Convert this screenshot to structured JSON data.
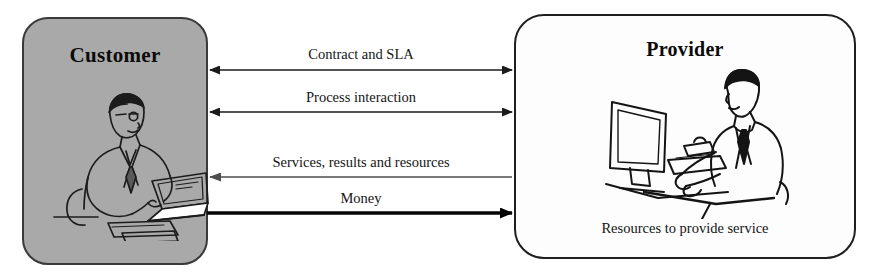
{
  "diagram": {
    "canvas": {
      "width": 873,
      "height": 276,
      "background": "#ffffff"
    },
    "entities": [
      {
        "id": "customer",
        "label": "Customer",
        "caption": "",
        "fill": "#a9a9a9",
        "stroke": "#3a3a3a",
        "illustration": "businessman-at-laptop-icon"
      },
      {
        "id": "provider",
        "label": "Provider",
        "caption": "Resources to provide service",
        "fill": "#fdfdfd",
        "stroke": "#1f1f1f",
        "illustration": "person-at-desktop-computer-icon"
      }
    ],
    "flows": [
      {
        "id": "contract-and-sla",
        "label": "Contract and SLA",
        "direction": "bidirectional",
        "from": "customer",
        "to": "provider",
        "stroke": "#1a1a1a",
        "weight": "thin",
        "y": 70
      },
      {
        "id": "process-interaction",
        "label": "Process interaction",
        "direction": "bidirectional",
        "from": "customer",
        "to": "provider",
        "stroke": "#1a1a1a",
        "weight": "thin",
        "y": 112
      },
      {
        "id": "services-results-and-resources",
        "label": "Services, results and resources",
        "direction": "right-to-left",
        "from": "provider",
        "to": "customer",
        "stroke": "#4d4d4d",
        "weight": "thin",
        "y": 177
      },
      {
        "id": "money",
        "label": "Money",
        "direction": "left-to-right",
        "from": "customer",
        "to": "provider",
        "stroke": "#050505",
        "weight": "thick",
        "y": 213
      }
    ]
  }
}
